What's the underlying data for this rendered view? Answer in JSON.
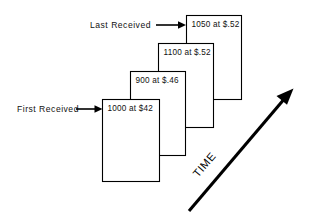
{
  "figure": {
    "background_color": "#ffffff",
    "line_color": "#000000",
    "text_color": "#111111"
  },
  "labels": {
    "first_received": "First Received",
    "last_received": "Last Received",
    "time_axis": "TIME"
  },
  "cards": [
    {
      "id": "card-1",
      "text": "1000  at  $42",
      "quantity": "1000",
      "connector": "at",
      "price": "$42"
    },
    {
      "id": "card-2",
      "text": "900  at  $.46",
      "quantity": "900",
      "connector": "at",
      "price": "$.46"
    },
    {
      "id": "card-3",
      "text": "1100  at  $.52",
      "quantity": "1100",
      "connector": "at",
      "price": "$.52"
    },
    {
      "id": "card-4",
      "text": "1050  at  $.52",
      "quantity": "1050",
      "connector": "at",
      "price": "$.52"
    }
  ]
}
